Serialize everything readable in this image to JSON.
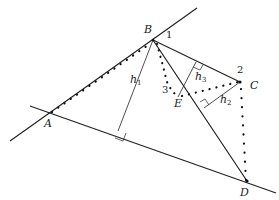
{
  "points": {
    "A": {
      "label": "A",
      "x": 50,
      "y": 113
    },
    "B": {
      "label": "B",
      "x": 153,
      "y": 40
    },
    "C": {
      "label": "C",
      "x": 240,
      "y": 82
    },
    "D": {
      "label": "D",
      "x": 247,
      "y": 181
    },
    "E": {
      "label": "E",
      "x": 178,
      "y": 97
    }
  },
  "angle_labels": {
    "one": "1",
    "two": "2",
    "three": "3"
  },
  "heights": {
    "h1": {
      "base": "h",
      "sub": "1"
    },
    "h2": {
      "base": "h",
      "sub": "2"
    },
    "h3": {
      "base": "h",
      "sub": "3"
    }
  },
  "colors": {
    "stroke": "#222222",
    "background": "#ffffff"
  }
}
